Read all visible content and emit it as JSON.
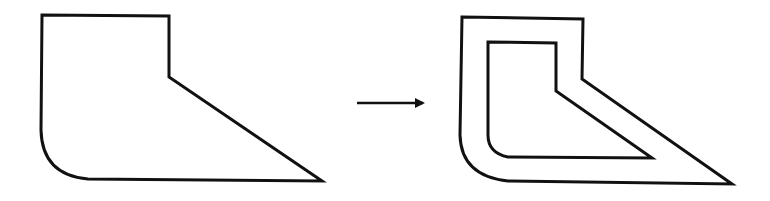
{
  "diagram": {
    "stroke_color": "#111111",
    "background": "#ffffff",
    "source_shape": {
      "path": "M42,15 L169,16 L169,77 L322,181 L88,179 Q42,175 41,130 Z"
    },
    "arrow": {
      "x1": 357,
      "y1": 103,
      "x2": 423,
      "y2": 103,
      "direction": "right"
    },
    "result_shape": {
      "outer_path": "M462,17 L583,19 L582,79 L732,184 L508,181 Q461,176 460,135 Z",
      "inner_path": "M488,42 L556,43 L556,91 L652,158 L508,157 Q488,153 488,135 Z"
    }
  }
}
